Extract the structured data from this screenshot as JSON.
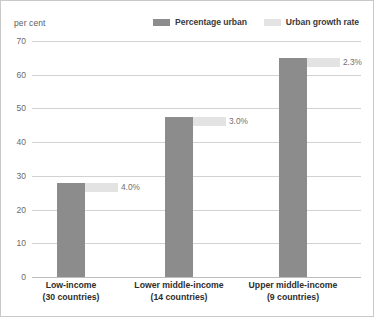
{
  "chart_data": {
    "type": "bar",
    "title": "",
    "subtitle": "",
    "xlabel": "",
    "ylabel": "per cent",
    "ylim": [
      0,
      70
    ],
    "ytick_labels": [
      "70",
      "60",
      "50",
      "40",
      "30",
      "20",
      "10",
      "0"
    ],
    "ytick_values": [
      70,
      60,
      50,
      40,
      30,
      20,
      10,
      0
    ],
    "grid": true,
    "legend_position": "top-right",
    "categories": [
      "Low-income",
      "Lower middle-income",
      "Upper middle-income"
    ],
    "category_sublabels": [
      "(30 countries)",
      "(14 countries)",
      "(9 countries)"
    ],
    "series": [
      {
        "name": "Percentage urban",
        "color": "#8c8c8c",
        "values": [
          28.0,
          47.5,
          65.0
        ]
      },
      {
        "name": "Urban growth rate",
        "color": "#e3e3e3",
        "values": [
          4.0,
          3.0,
          2.3
        ],
        "data_labels": [
          "4.0%",
          "3.0%",
          "2.3%"
        ]
      }
    ]
  },
  "legend": {
    "items": [
      {
        "label": "Percentage urban",
        "color": "#8c8c8c"
      },
      {
        "label": "Urban growth rate",
        "color": "#e3e3e3"
      }
    ]
  },
  "axis": {
    "unit_label": "per cent"
  },
  "colors": {
    "percentage_urban": "#8c8c8c",
    "urban_growth_rate": "#e3e3e3",
    "gridline": "#d2d2d2",
    "frame": "#c9c9c9",
    "background": "#ffffff",
    "tick_text": "#6b6b6b",
    "category_text": "#2d2d2d"
  }
}
